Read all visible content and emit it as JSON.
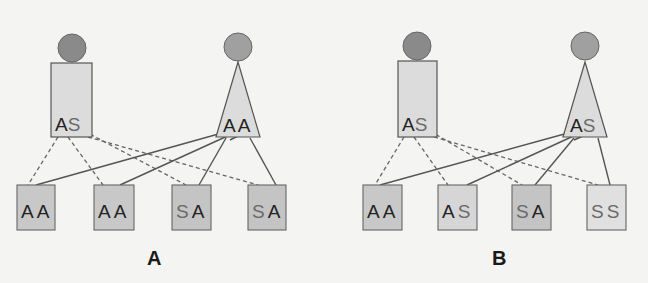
{
  "colors": {
    "background": "#f4f4f2",
    "head_circle": "#8a8a8a",
    "parent_fill": "#dcdcdc",
    "child_dark": "#c4c4c4",
    "child_light": "#dadada",
    "stroke": "#555555",
    "allele_A": "#222222",
    "allele_S": "#6a6a6a"
  },
  "panels": [
    {
      "label": "A",
      "parents": [
        {
          "shape": "rectangle",
          "sex": "male",
          "genotype": [
            "A",
            "S"
          ]
        },
        {
          "shape": "triangle",
          "sex": "female",
          "genotype": [
            "A",
            "A"
          ]
        }
      ],
      "children": [
        {
          "genotype": [
            "A",
            "A"
          ]
        },
        {
          "genotype": [
            "A",
            "A"
          ]
        },
        {
          "genotype": [
            "S",
            "A"
          ]
        },
        {
          "genotype": [
            "S",
            "A"
          ]
        }
      ]
    },
    {
      "label": "B",
      "parents": [
        {
          "shape": "rectangle",
          "sex": "male",
          "genotype": [
            "A",
            "S"
          ]
        },
        {
          "shape": "triangle",
          "sex": "female",
          "genotype": [
            "A",
            "S"
          ]
        }
      ],
      "children": [
        {
          "genotype": [
            "A",
            "A"
          ]
        },
        {
          "genotype": [
            "A",
            "S"
          ]
        },
        {
          "genotype": [
            "S",
            "A"
          ]
        },
        {
          "genotype": [
            "S",
            "S"
          ]
        }
      ]
    }
  ]
}
